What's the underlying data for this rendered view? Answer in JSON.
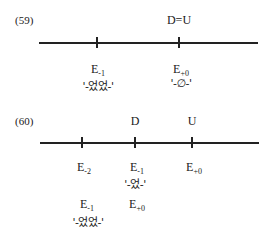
{
  "diagram59": {
    "number": "(59)",
    "top_label": "D=U",
    "points": [
      {
        "e_base": "E",
        "e_sub": "-1",
        "morpheme": "'-었었-'"
      },
      {
        "e_base": "E",
        "e_sub": "+0",
        "morpheme": "'-∅-'"
      }
    ]
  },
  "diagram60": {
    "number": "(60)",
    "top_labels": [
      "D",
      "U"
    ],
    "row1": [
      {
        "e_base": "E",
        "e_sub": "-2"
      },
      {
        "e_base": "E",
        "e_sub": "-1"
      },
      {
        "e_base": "E",
        "e_sub": "+0"
      }
    ],
    "row1_morpheme": "'-었-'",
    "row2": [
      {
        "e_base": "E",
        "e_sub": "-1"
      },
      {
        "e_base": "E",
        "e_sub": "+0"
      }
    ],
    "row2_morpheme": "'-었었-'"
  }
}
